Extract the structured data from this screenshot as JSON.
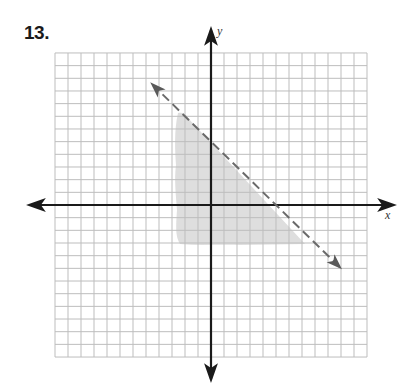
{
  "problem": {
    "number_label": "13."
  },
  "graph": {
    "x_axis_label": "x",
    "y_axis_label": "y",
    "grid": {
      "x_min": -12,
      "x_max": 12,
      "y_min": -12,
      "y_max": 12,
      "step": 1
    },
    "colors": {
      "grid": "#bdbdbd",
      "axes": "#1a1a1a",
      "boundary_line": "#6a6a6a",
      "shading": "#dcdcdc"
    }
  },
  "chart_data": {
    "type": "line",
    "title": "13.",
    "xlabel": "x",
    "ylabel": "y",
    "xlim": [
      -12,
      12
    ],
    "ylim": [
      -12,
      12
    ],
    "grid": true,
    "series": [
      {
        "name": "boundary line y = -x + 5 (dashed, strict inequality)",
        "style": "dashed",
        "arrows": "both",
        "x": [
          -4.5,
          0,
          5,
          9.9
        ],
        "y": [
          9.5,
          5,
          0,
          -4.9
        ]
      }
    ],
    "intercepts": {
      "x_intercept": 5,
      "y_intercept": 5
    },
    "shaded_region": {
      "description": "Half-plane below/left of dashed line (x + y < 5), shown as a light gray shaded patch",
      "approx_polygon": [
        [
          -2.5,
          7.2
        ],
        [
          -1.8,
          6.8
        ],
        [
          7.4,
          -3.0
        ],
        [
          -2.7,
          -3.0
        ],
        [
          -2.6,
          0
        ]
      ]
    }
  }
}
